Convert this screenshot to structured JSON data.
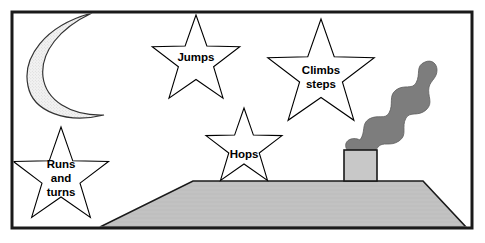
{
  "figure": {
    "frame": {
      "name": "picture-border",
      "x": 12,
      "y": 12,
      "width": 460,
      "height": 216,
      "stroke_color": "#1a1a1a",
      "stroke_width": 3,
      "fill_color": "#ffffff"
    },
    "colors": {
      "outline": "#000000",
      "star_fill": "#ffffff",
      "moon_fill": "#efefef",
      "ground_fill": "#c0c0c0",
      "chimney_fill": "#c8c8c8",
      "smoke_fill": "#7d7d7d",
      "frame_stroke": "#1a1a1a",
      "text": "#000000",
      "page_background": "#ffffff"
    },
    "moon": {
      "name": "crescent-moon",
      "outer": "M 92,13 C 44,26 22,58 28,86 C 33,112 67,124 104,115 C 70,116 46,100 43,77 C 40,52 60,28 92,13 Z",
      "fill": "#efefef",
      "stipple": true
    },
    "ground": {
      "name": "ground-plane",
      "points": "193,181 423,181 466,227 100,227",
      "fill": "#c0c0c0"
    },
    "chimney": {
      "name": "chimney-block",
      "x": 344,
      "y": 150,
      "width": 33,
      "height": 31,
      "fill": "#c8c8c8"
    },
    "smoke": {
      "name": "smoke-plume",
      "path": "M 347,150 C 342,141 352,136 360,140 C 366,132 361,124 369,119 C 378,114 385,120 389,113 C 394,104 388,96 396,90 C 404,84 412,90 416,83 C 421,74 415,66 425,62 C 432,59 437,64 437,70 C 437,78 431,80 429,87 C 427,96 434,103 426,110 C 418,117 410,111 406,118 C 401,127 408,135 399,141 C 390,147 383,141 378,147 C 372,154 377,161 368,164 C 359,167 353,159 347,150 Z",
      "fill": "#7d7d7d"
    },
    "stars": [
      {
        "name": "star-jumps",
        "label": "Jumps",
        "lines": [
          "Jumps"
        ],
        "cx": 196,
        "cy": 61,
        "outer_r": 46,
        "inner_r": 18.5,
        "label_x": 196,
        "label_y": 58
      },
      {
        "name": "star-climbs-steps",
        "label": "Climbs steps",
        "lines": [
          "Climbs",
          "steps"
        ],
        "cx": 321,
        "cy": 75,
        "outer_r": 56,
        "inner_r": 22.5,
        "label_x": 321,
        "label_y": 78
      },
      {
        "name": "star-hops",
        "label": "Hops",
        "lines": [
          "Hops"
        ],
        "cx": 244,
        "cy": 148,
        "outer_r": 40,
        "inner_r": 16,
        "label_x": 244,
        "label_y": 155
      },
      {
        "name": "star-runs-and-turns",
        "label": "Runs and turns",
        "lines": [
          "Runs",
          "and",
          "turns"
        ],
        "cx": 61,
        "cy": 177,
        "outer_r": 50,
        "inner_r": 20,
        "label_x": 61,
        "label_y": 179
      }
    ]
  }
}
